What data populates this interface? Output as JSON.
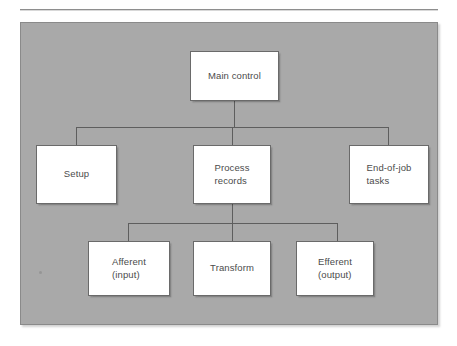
{
  "figure": {
    "kind": "structure-chart",
    "background_color": "#ffffff",
    "panel_color": "#a9a9a9",
    "node_fill_color": "#ffffff",
    "node_border_color": "#6a6a6a",
    "connector_color": "#5e5e5e",
    "text_color": "#4b4b4b"
  },
  "diagram": {
    "levels": [
      {
        "level": 1,
        "nodes": [
          {
            "id": "main-control",
            "label": "Main control",
            "align": "center"
          }
        ]
      },
      {
        "level": 2,
        "nodes": [
          {
            "id": "setup",
            "label": "Setup",
            "align": "center"
          },
          {
            "id": "process-records",
            "label": "Process\nrecords",
            "align": "left"
          },
          {
            "id": "end-of-job-tasks",
            "label": "End-of-job\ntasks",
            "align": "left"
          }
        ]
      },
      {
        "level": 3,
        "nodes": [
          {
            "id": "afferent-input",
            "label": "Afferent\n(input)",
            "align": "left"
          },
          {
            "id": "transform",
            "label": "Transform",
            "align": "center"
          },
          {
            "id": "efferent-output",
            "label": "Efferent\n(output)",
            "align": "left"
          }
        ]
      }
    ],
    "edges": [
      {
        "from": "main-control",
        "to": "setup"
      },
      {
        "from": "main-control",
        "to": "process-records"
      },
      {
        "from": "main-control",
        "to": "end-of-job-tasks"
      },
      {
        "from": "process-records",
        "to": "afferent-input"
      },
      {
        "from": "process-records",
        "to": "transform"
      },
      {
        "from": "process-records",
        "to": "efferent-output"
      }
    ]
  }
}
